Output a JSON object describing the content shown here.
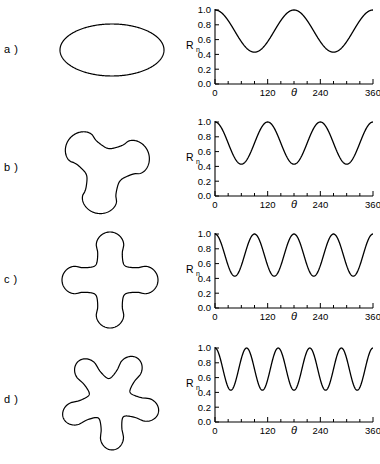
{
  "figure": {
    "title": "",
    "panels": [
      {
        "label": "a )",
        "label_short": "a",
        "shape_name": "ellipse-2-lobe",
        "lobes": 2
      },
      {
        "label": "b )",
        "label_short": "b",
        "shape_name": "trefoil-3-lobe",
        "lobes": 3
      },
      {
        "label": "c )",
        "label_short": "c",
        "shape_name": "cross-4-lobe",
        "lobes": 4
      },
      {
        "label": "d )",
        "label_short": "d",
        "shape_name": "star-5-lobe",
        "lobes": 5
      }
    ]
  },
  "axis": {
    "ylabel_main": "R",
    "ylabel_sub": "n",
    "xlabel": "θ",
    "ytick_labels": [
      "0.0",
      "0.2",
      "0.4",
      "0.6",
      "0.8",
      "1.0"
    ],
    "ytick_values": [
      0.0,
      0.2,
      0.4,
      0.6,
      0.8,
      1.0
    ],
    "xtick_labels": [
      "0",
      "120",
      "240",
      "360"
    ],
    "xtick_values": [
      0,
      120,
      240,
      360
    ],
    "xminor_step": 30,
    "ylim": [
      0.0,
      1.0
    ],
    "xlim": [
      0,
      360
    ],
    "grid": false,
    "line_color": "#000000"
  },
  "chart_data": [
    {
      "type": "line",
      "title": "a)",
      "xlabel": "θ",
      "ylabel": "Rn",
      "xlim": [
        0,
        360
      ],
      "ylim": [
        0.0,
        1.0
      ],
      "n": 2,
      "formula": "Rn = 0.715 + 0.285*cos(2*theta)",
      "r_min": 0.43,
      "r_max": 1.0,
      "periods": 2,
      "x": [
        0,
        15,
        30,
        45,
        60,
        75,
        90,
        105,
        120,
        135,
        150,
        165,
        180,
        195,
        210,
        225,
        240,
        255,
        270,
        285,
        300,
        315,
        330,
        345,
        360
      ],
      "y": [
        1.0,
        0.98,
        0.93,
        0.86,
        0.77,
        0.68,
        0.6,
        0.51,
        0.46,
        0.43,
        0.43,
        0.47,
        0.55,
        0.64,
        0.74,
        0.84,
        0.93,
        0.98,
        1.0,
        0.97,
        0.9,
        0.8,
        0.68,
        0.56,
        1.0
      ],
      "xticks": [
        0,
        120,
        240,
        360
      ],
      "yticks": [
        0.0,
        0.2,
        0.4,
        0.6,
        0.8,
        1.0
      ],
      "grid": false,
      "legend": "none"
    },
    {
      "type": "line",
      "title": "b)",
      "xlabel": "θ",
      "ylabel": "Rn",
      "xlim": [
        0,
        360
      ],
      "ylim": [
        0.0,
        1.0
      ],
      "n": 3,
      "formula": "Rn = 0.715 + 0.285*cos(3*theta)",
      "r_min": 0.43,
      "r_max": 1.0,
      "periods": 3,
      "x": [
        0,
        30,
        60,
        90,
        120,
        150,
        180,
        210,
        240,
        270,
        300,
        330,
        360
      ],
      "y": [
        1.0,
        0.86,
        0.57,
        0.43,
        1.0,
        0.86,
        0.57,
        0.43,
        1.0,
        0.86,
        0.57,
        0.43,
        1.0
      ],
      "xticks": [
        0,
        120,
        240,
        360
      ],
      "yticks": [
        0.0,
        0.2,
        0.4,
        0.6,
        0.8,
        1.0
      ],
      "grid": false,
      "legend": "none"
    },
    {
      "type": "line",
      "title": "c)",
      "xlabel": "θ",
      "ylabel": "Rn",
      "xlim": [
        0,
        360
      ],
      "ylim": [
        0.0,
        1.0
      ],
      "n": 4,
      "formula": "Rn = 0.715 + 0.285*cos(4*theta)",
      "r_min": 0.43,
      "r_max": 1.0,
      "periods": 4,
      "x": [
        0,
        22.5,
        45,
        67.5,
        90,
        112.5,
        135,
        157.5,
        180,
        202.5,
        225,
        247.5,
        270,
        292.5,
        315,
        337.5,
        360
      ],
      "y": [
        1.0,
        0.86,
        0.43,
        0.86,
        1.0,
        0.86,
        0.43,
        0.86,
        1.0,
        0.86,
        0.43,
        0.86,
        1.0,
        0.86,
        0.43,
        0.86,
        1.0
      ],
      "xticks": [
        0,
        120,
        240,
        360
      ],
      "yticks": [
        0.0,
        0.2,
        0.4,
        0.6,
        0.8,
        1.0
      ],
      "grid": false,
      "legend": "none"
    },
    {
      "type": "line",
      "title": "d)",
      "xlabel": "θ",
      "ylabel": "Rn",
      "xlim": [
        0,
        360
      ],
      "ylim": [
        0.0,
        1.0
      ],
      "n": 5,
      "formula": "Rn = 0.715 + 0.285*cos(5*theta)",
      "r_min": 0.43,
      "r_max": 1.0,
      "periods": 5,
      "x": [
        0,
        18,
        36,
        54,
        72,
        90,
        108,
        126,
        144,
        162,
        180,
        198,
        216,
        234,
        252,
        270,
        288,
        306,
        324,
        342,
        360
      ],
      "y": [
        1.0,
        0.86,
        0.43,
        0.86,
        1.0,
        0.86,
        0.43,
        0.86,
        1.0,
        0.86,
        0.43,
        0.86,
        1.0,
        0.86,
        0.43,
        0.86,
        1.0,
        0.86,
        0.43,
        0.86,
        1.0
      ],
      "xticks": [
        0,
        120,
        240,
        360
      ],
      "yticks": [
        0.0,
        0.2,
        0.4,
        0.6,
        0.8,
        1.0
      ],
      "grid": false,
      "legend": "none"
    }
  ]
}
